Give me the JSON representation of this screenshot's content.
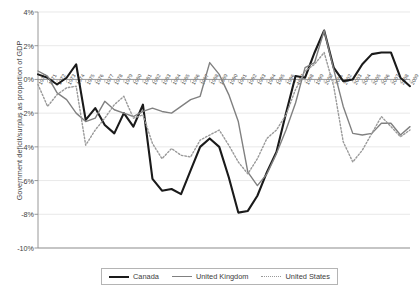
{
  "chart_data": {
    "type": "line",
    "title": "",
    "xlabel": "",
    "ylabel": "Government deficit/surplus as proportion of GDP",
    "ylim": [
      -10,
      4
    ],
    "yticks": [
      "4%",
      "2%",
      "0%",
      "-2%",
      "-4%",
      "-6%",
      "-8%",
      "-10%"
    ],
    "ytick_values": [
      4,
      2,
      0,
      -2,
      -4,
      -6,
      -8,
      -10
    ],
    "grid": true,
    "legend_position": "bottom",
    "x": [
      "1970",
      "1971",
      "1972",
      "1973",
      "1974",
      "1975",
      "1976",
      "1977",
      "1978",
      "1979",
      "1980",
      "1981",
      "1982",
      "1983",
      "1984",
      "1985",
      "1986",
      "1987",
      "1988",
      "1989",
      "1990",
      "1991",
      "1992",
      "1993",
      "1994",
      "1995",
      "1996",
      "1997",
      "1998",
      "1999",
      "2000",
      "2001",
      "2002",
      "2003",
      "2004",
      "2005",
      "2006",
      "2007",
      "2008",
      "2009"
    ],
    "series": [
      {
        "name": "Canada",
        "style": "solid-thick",
        "color": "#1a1a1a",
        "values": [
          0.3,
          0.1,
          -0.3,
          0.1,
          0.9,
          -2.4,
          -1.7,
          -2.7,
          -3.2,
          -2.0,
          -2.8,
          -1.5,
          -5.9,
          -6.6,
          -6.5,
          -6.8,
          -5.4,
          -4.0,
          -3.5,
          -4.0,
          -5.8,
          -7.9,
          -7.8,
          -6.9,
          -5.5,
          -4.3,
          -2.0,
          0.2,
          0.1,
          1.6,
          2.9,
          0.7,
          -0.1,
          0.0,
          0.9,
          1.5,
          1.6,
          1.6,
          0.1,
          -0.4
        ]
      },
      {
        "name": "United Kingdom",
        "style": "solid",
        "color": "#808080",
        "values": [
          0.5,
          0.2,
          -0.8,
          -1.2,
          -2.0,
          -2.5,
          -2.3,
          -1.3,
          -1.8,
          -2.0,
          -2.2,
          -1.9,
          -1.7,
          -1.9,
          -2.0,
          -1.6,
          -1.2,
          -1.0,
          1.0,
          0.3,
          -0.9,
          -2.5,
          -5.5,
          -6.3,
          -5.6,
          -4.4,
          -3.0,
          -1.4,
          0.7,
          1.0,
          2.9,
          0.6,
          -1.6,
          -3.2,
          -3.3,
          -3.2,
          -2.6,
          -2.6,
          -3.3,
          -2.8
        ]
      },
      {
        "name": "United States",
        "style": "dotted",
        "color": "#999999",
        "values": [
          -0.3,
          -1.6,
          -0.9,
          -0.5,
          -0.4,
          -3.9,
          -3.0,
          -2.3,
          -1.5,
          -1.0,
          -2.3,
          -2.1,
          -3.8,
          -4.7,
          -4.1,
          -4.5,
          -4.6,
          -3.6,
          -3.3,
          -3.0,
          -3.9,
          -4.9,
          -5.6,
          -4.7,
          -3.5,
          -3.0,
          -2.1,
          -0.6,
          0.5,
          0.9,
          1.6,
          -0.4,
          -3.7,
          -4.9,
          -4.2,
          -3.2,
          -2.2,
          -2.8,
          -3.4,
          -3.0
        ]
      }
    ]
  },
  "legend": {
    "items": [
      {
        "label": "Canada"
      },
      {
        "label": "United Kingdom"
      },
      {
        "label": "United States"
      }
    ]
  }
}
